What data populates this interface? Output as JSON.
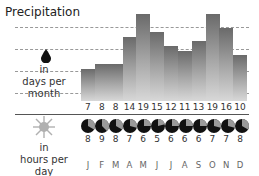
{
  "title": "Precipitation",
  "precip_label": [
    "in",
    "days per",
    "month"
  ],
  "sun_label": [
    "in",
    "hours per",
    "day"
  ],
  "colors": {
    "bar_top": "#6a6a6a",
    "bar_bottom": "#d8d8d8",
    "pie_dark": "#111111",
    "pie_light": "#9a9a9a",
    "sun": "#b0b0b0"
  },
  "months": [
    "J",
    "F",
    "M",
    "A",
    "M",
    "J",
    "J",
    "A",
    "S",
    "O",
    "N",
    "D"
  ],
  "rain_days": [
    7,
    8,
    8,
    14,
    19,
    15,
    12,
    11,
    13,
    19,
    16,
    10
  ],
  "sun_hours": [
    8,
    9,
    8,
    7,
    6,
    5,
    6,
    6,
    6,
    7,
    7,
    8
  ],
  "chart_data": {
    "type": "bar",
    "title": "Precipitation",
    "categories": [
      "J",
      "F",
      "M",
      "A",
      "M",
      "J",
      "J",
      "A",
      "S",
      "O",
      "N",
      "D"
    ],
    "series": [
      {
        "name": "Precipitation in days per month",
        "values": [
          7,
          8,
          8,
          14,
          19,
          15,
          12,
          11,
          13,
          19,
          16,
          10
        ]
      },
      {
        "name": "Sunshine in hours per day",
        "values": [
          8,
          9,
          8,
          7,
          6,
          5,
          6,
          6,
          6,
          7,
          7,
          8
        ]
      }
    ],
    "xlabel": "",
    "ylabel": "days per month",
    "grid": true,
    "legend": "left labels"
  }
}
